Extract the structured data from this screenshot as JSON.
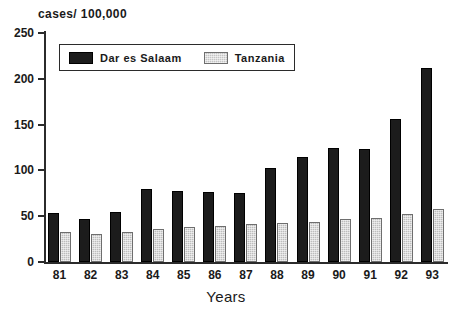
{
  "chart_data": {
    "type": "bar",
    "title": "",
    "ylabel": "cases/ 100,000",
    "xlabel": "Years",
    "ylim": [
      0,
      250
    ],
    "yticks": [
      0,
      50,
      100,
      150,
      200,
      250
    ],
    "grid": false,
    "legend_position": "top-left-inside",
    "categories": [
      "81",
      "82",
      "83",
      "84",
      "85",
      "86",
      "87",
      "88",
      "89",
      "90",
      "91",
      "92",
      "93"
    ],
    "series": [
      {
        "name": "Dar es Salaam",
        "color": "#1c1c1c",
        "values": [
          53,
          47,
          55,
          80,
          77,
          76,
          75,
          103,
          115,
          125,
          123,
          156,
          212
        ]
      },
      {
        "name": "Tanzania",
        "color": "#bdbdbd",
        "values": [
          33,
          31,
          33,
          36,
          38,
          39,
          41,
          43,
          44,
          47,
          48,
          52,
          58
        ]
      }
    ]
  },
  "axis": {
    "y_title": "cases/ 100,000",
    "x_title": "Years",
    "y_tick_labels": [
      "250",
      "200",
      "150",
      "100",
      "50",
      "0"
    ],
    "x_tick_labels": [
      "81",
      "82",
      "83",
      "84",
      "85",
      "86",
      "87",
      "88",
      "89",
      "90",
      "91",
      "92",
      "93"
    ]
  },
  "legend": {
    "items": [
      {
        "label": "Dar es Salaam",
        "swatch": "dark-solid-swatch"
      },
      {
        "label": "Tanzania",
        "swatch": "light-hatched-swatch"
      }
    ]
  },
  "colors": {
    "dar_es_salaam": "#1c1c1c",
    "tanzania": "#bdbdbd",
    "axis": "#2b2b2b",
    "background": "#ffffff"
  }
}
